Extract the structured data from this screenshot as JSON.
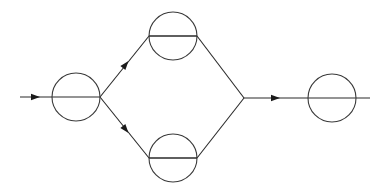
{
  "diagram": {
    "type": "feynman-like-graph",
    "colors": {
      "background": "#ffffff",
      "stroke": "#2a2a2a"
    },
    "nodes": [
      {
        "id": "input-node",
        "cx": 76,
        "cy": 97,
        "r": 24,
        "chord": false
      },
      {
        "id": "upper-node",
        "cx": 173,
        "cy": 36,
        "r": 24,
        "chord": true
      },
      {
        "id": "lower-node",
        "cx": 173,
        "cy": 158,
        "r": 24,
        "chord": true
      },
      {
        "id": "output-node",
        "cx": 332,
        "cy": 98,
        "r": 24,
        "chord": false
      }
    ],
    "junction": {
      "x": 244,
      "y": 98
    },
    "edges": [
      {
        "id": "incoming-line",
        "from": [
          20,
          97
        ],
        "to": [
          100,
          97
        ],
        "arrow_at": [
          36,
          97
        ]
      },
      {
        "id": "upper-branch-in",
        "from": [
          100,
          97
        ],
        "to": [
          149,
          36
        ],
        "arrow_at": [
          126,
          64
        ]
      },
      {
        "id": "lower-branch-in",
        "from": [
          100,
          97
        ],
        "to": [
          149,
          158
        ],
        "arrow_at": [
          126,
          130
        ]
      },
      {
        "id": "upper-branch-out",
        "from": [
          197,
          36
        ],
        "to": [
          244,
          98
        ]
      },
      {
        "id": "lower-branch-out",
        "from": [
          197,
          158
        ],
        "to": [
          244,
          98
        ]
      },
      {
        "id": "outgoing-line",
        "from": [
          244,
          98
        ],
        "to": [
          370,
          98
        ],
        "arrow_at": [
          276,
          98
        ]
      }
    ]
  }
}
